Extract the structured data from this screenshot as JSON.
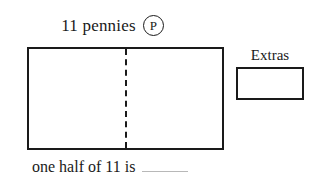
{
  "worksheet": {
    "title": {
      "text": "11 pennies",
      "badge_letter": "P",
      "badge_icon": "circled-letter-p-icon"
    },
    "main_box": {
      "label": "",
      "halves": [
        "",
        ""
      ],
      "divider_style": "dashed"
    },
    "extras": {
      "label": "Extras",
      "box_value": ""
    },
    "prompt": {
      "text": "one half of 11 is",
      "answer_value": ""
    },
    "colors": {
      "ink": "#1a1a1a",
      "background": "#ffffff",
      "blank_line": "#b8b8b8"
    }
  }
}
